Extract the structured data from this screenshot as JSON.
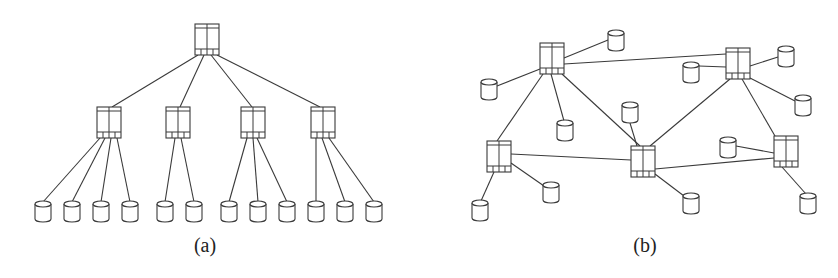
{
  "figure": {
    "panels": [
      {
        "id": "a",
        "caption": "(a)",
        "topology": "hierarchical-tree",
        "switches": [
          {
            "id": "a-root",
            "level": 0
          },
          {
            "id": "a-s1",
            "level": 1
          },
          {
            "id": "a-s2",
            "level": 1
          },
          {
            "id": "a-s3",
            "level": 1
          },
          {
            "id": "a-s4",
            "level": 1
          }
        ],
        "storage_nodes": [
          {
            "id": "a-d1",
            "parent": "a-s1"
          },
          {
            "id": "a-d2",
            "parent": "a-s1"
          },
          {
            "id": "a-d3",
            "parent": "a-s1"
          },
          {
            "id": "a-d4",
            "parent": "a-s1"
          },
          {
            "id": "a-d5",
            "parent": "a-s2"
          },
          {
            "id": "a-d6",
            "parent": "a-s2"
          },
          {
            "id": "a-d7",
            "parent": "a-s3"
          },
          {
            "id": "a-d8",
            "parent": "a-s3"
          },
          {
            "id": "a-d9",
            "parent": "a-s3"
          },
          {
            "id": "a-d10",
            "parent": "a-s4"
          },
          {
            "id": "a-d11",
            "parent": "a-s4"
          },
          {
            "id": "a-d12",
            "parent": "a-s4"
          }
        ],
        "links": [
          [
            "a-root",
            "a-s1"
          ],
          [
            "a-root",
            "a-s2"
          ],
          [
            "a-root",
            "a-s3"
          ],
          [
            "a-root",
            "a-s4"
          ]
        ]
      },
      {
        "id": "b",
        "caption": "(b)",
        "topology": "mesh",
        "switches": [
          {
            "id": "b-s1"
          },
          {
            "id": "b-s2"
          },
          {
            "id": "b-s3"
          },
          {
            "id": "b-s4"
          },
          {
            "id": "b-s5"
          }
        ],
        "storage_nodes": [
          {
            "id": "b-d1",
            "parent": "b-s1"
          },
          {
            "id": "b-d2",
            "parent": "b-s1"
          },
          {
            "id": "b-d3",
            "parent": "b-s1"
          },
          {
            "id": "b-d4",
            "parent": "b-s2"
          },
          {
            "id": "b-d5",
            "parent": "b-s2"
          },
          {
            "id": "b-d6",
            "parent": "b-s2"
          },
          {
            "id": "b-d7",
            "parent": "b-s3"
          },
          {
            "id": "b-d8",
            "parent": "b-s3"
          },
          {
            "id": "b-d9",
            "parent": "b-s4"
          },
          {
            "id": "b-d10",
            "parent": "b-s4"
          },
          {
            "id": "b-d11",
            "parent": "b-s5"
          },
          {
            "id": "b-d12",
            "parent": "b-s5"
          }
        ],
        "links": [
          [
            "b-s1",
            "b-s2"
          ],
          [
            "b-s1",
            "b-s3"
          ],
          [
            "b-s1",
            "b-s4"
          ],
          [
            "b-s2",
            "b-s4"
          ],
          [
            "b-s2",
            "b-s5"
          ],
          [
            "b-s3",
            "b-s4"
          ],
          [
            "b-s4",
            "b-s5"
          ]
        ]
      }
    ],
    "icons": {
      "switch": "network-switch-icon",
      "storage": "storage-cylinder-icon"
    },
    "colors": {
      "stroke": "#3a3a3a",
      "background": "#ffffff"
    }
  }
}
